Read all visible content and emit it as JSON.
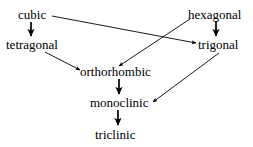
{
  "diagram": {
    "kind": "directed-graph",
    "background_color": "#ffffff",
    "stroke_color": "#000000",
    "text_color": "#000000",
    "width": 253,
    "height": 147,
    "nodes": [
      {
        "id": "cubic",
        "label": "cubic",
        "x": 18,
        "y": 8,
        "cx": 34,
        "cy": 15
      },
      {
        "id": "hexagonal",
        "label": "hexagonal",
        "x": 188,
        "y": 8,
        "cx": 218,
        "cy": 15
      },
      {
        "id": "tetragonal",
        "label": "tetragonal",
        "x": 6,
        "y": 38,
        "cx": 36,
        "cy": 45
      },
      {
        "id": "trigonal",
        "label": "trigonal",
        "x": 198,
        "y": 38,
        "cx": 221,
        "cy": 45
      },
      {
        "id": "orthorhombic",
        "label": "orthorhombic",
        "x": 80,
        "y": 65,
        "cx": 118,
        "cy": 72
      },
      {
        "id": "monoclinic",
        "label": "monoclinic",
        "x": 90,
        "y": 96,
        "cx": 120,
        "cy": 103
      },
      {
        "id": "triclinic",
        "label": "triclinic",
        "x": 95,
        "y": 128,
        "cx": 118,
        "cy": 135
      }
    ],
    "edges": [
      {
        "id": "cubic-to-tetragonal",
        "from": "cubic",
        "to": "tetragonal",
        "x1": 31,
        "y1": 22,
        "x2": 31,
        "y2": 36
      },
      {
        "id": "cubic-to-trigonal",
        "from": "cubic",
        "to": "trigonal",
        "x1": 52,
        "y1": 16,
        "x2": 196,
        "y2": 43
      },
      {
        "id": "hexagonal-to-trigonal",
        "from": "hexagonal",
        "to": "trigonal",
        "x1": 216,
        "y1": 21,
        "x2": 216,
        "y2": 36
      },
      {
        "id": "hexagonal-to-orthorhombic",
        "from": "hexagonal",
        "to": "orthorhombic",
        "x1": 190,
        "y1": 19,
        "x2": 119,
        "y2": 66
      },
      {
        "id": "tetragonal-to-orthorhombic",
        "from": "tetragonal",
        "to": "orthorhombic",
        "x1": 45,
        "y1": 52,
        "x2": 80,
        "y2": 70
      },
      {
        "id": "orthorhombic-to-monoclinic",
        "from": "orthorhombic",
        "to": "monoclinic",
        "x1": 119,
        "y1": 79,
        "x2": 119,
        "y2": 94
      },
      {
        "id": "trigonal-to-monoclinic",
        "from": "trigonal",
        "to": "monoclinic",
        "x1": 219,
        "y1": 53,
        "x2": 153,
        "y2": 102
      },
      {
        "id": "monoclinic-to-triclinic",
        "from": "monoclinic",
        "to": "triclinic",
        "x1": 118,
        "y1": 110,
        "x2": 118,
        "y2": 125
      }
    ]
  }
}
